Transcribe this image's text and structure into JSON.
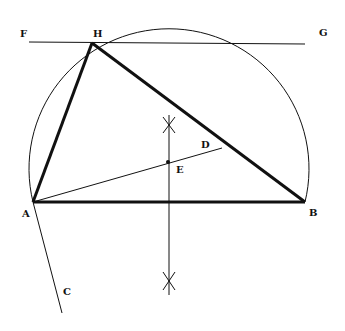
{
  "diagram": {
    "type": "geometric-construction",
    "colors": {
      "stroke": "#111111",
      "background": "#ffffff"
    },
    "points": {
      "A": {
        "label": "A",
        "x": 33,
        "y": 202
      },
      "B": {
        "label": "B",
        "x": 305,
        "y": 202
      },
      "H": {
        "label": "H",
        "x": 92,
        "y": 43
      },
      "E": {
        "label": "E",
        "x": 168,
        "y": 162
      },
      "D": {
        "label": "D",
        "x": 222,
        "y": 148
      },
      "F": {
        "label": "F",
        "x": 22,
        "y": 43
      },
      "G": {
        "label": "G",
        "x": 305,
        "y": 44
      },
      "C": {
        "label": "C",
        "x": 62,
        "y": 313
      }
    },
    "labels": [
      {
        "text": "F",
        "x": 20,
        "y": 37
      },
      {
        "text": "H",
        "x": 93,
        "y": 37
      },
      {
        "text": "G",
        "x": 319,
        "y": 36
      },
      {
        "text": "D",
        "x": 201,
        "y": 148
      },
      {
        "text": "E",
        "x": 176,
        "y": 173
      },
      {
        "text": "A",
        "x": 22,
        "y": 217
      },
      {
        "text": "B",
        "x": 309,
        "y": 216
      },
      {
        "text": "C",
        "x": 63,
        "y": 295
      }
    ]
  }
}
